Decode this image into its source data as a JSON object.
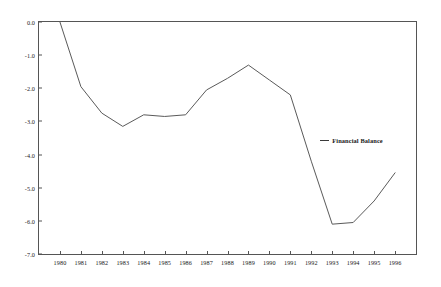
{
  "chart_data": {
    "type": "line",
    "title": "",
    "subtitle": "",
    "xlabel": "",
    "ylabel": "",
    "categories": [
      "1980",
      "1981",
      "1982",
      "1983",
      "1984",
      "1985",
      "1986",
      "1987",
      "1988",
      "1989",
      "1990",
      "1991",
      "1992",
      "1993",
      "1994",
      "1995",
      "1996"
    ],
    "series": [
      {
        "name": "Financial Balance",
        "values": [
          0.0,
          -1.95,
          -2.75,
          -3.15,
          -2.8,
          -2.85,
          -2.8,
          -2.05,
          -1.7,
          -1.3,
          -1.75,
          -2.2,
          -4.2,
          -6.1,
          -6.05,
          -5.4,
          -4.55
        ]
      }
    ],
    "ylim": [
      -7.0,
      0.0
    ],
    "yticks": [
      "0.0",
      "-1.0",
      "-2.0",
      "-3.0",
      "-4.0",
      "-5.0",
      "-6.0",
      "-7.0"
    ],
    "ytick_values": [
      0.0,
      -1.0,
      -2.0,
      -3.0,
      -4.0,
      -5.0,
      -6.0,
      -7.0
    ],
    "grid": false,
    "legend_position": "none",
    "annotations": [
      {
        "text": "Financial Balance",
        "target_year": "1992",
        "target_value": -3.6
      }
    ],
    "colors": {
      "line": "#5a5a5a",
      "axis": "#555555",
      "text": "#1a1a1a"
    }
  }
}
